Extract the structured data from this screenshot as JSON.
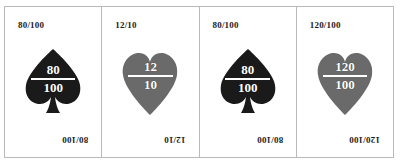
{
  "figure": {
    "card_count": 4,
    "frame_border_color": "#b9b9b9",
    "background_color": "#ffffff"
  },
  "cards": [
    {
      "id": "card-1",
      "suit": "spade",
      "suit_icon": "spade-icon",
      "color": "#1a1a1a",
      "corner_label": "80/100",
      "numerator": "80",
      "denominator": "100"
    },
    {
      "id": "card-2",
      "suit": "heart",
      "suit_icon": "heart-icon",
      "color": "#6a6a6a",
      "corner_label": "12/10",
      "numerator": "12",
      "denominator": "10"
    },
    {
      "id": "card-3",
      "suit": "spade",
      "suit_icon": "spade-icon",
      "color": "#1a1a1a",
      "corner_label": "80/100",
      "numerator": "80",
      "denominator": "100"
    },
    {
      "id": "card-4",
      "suit": "heart",
      "suit_icon": "heart-icon",
      "color": "#6a6a6a",
      "corner_label": "120/100",
      "numerator": "120",
      "denominator": "100"
    }
  ]
}
